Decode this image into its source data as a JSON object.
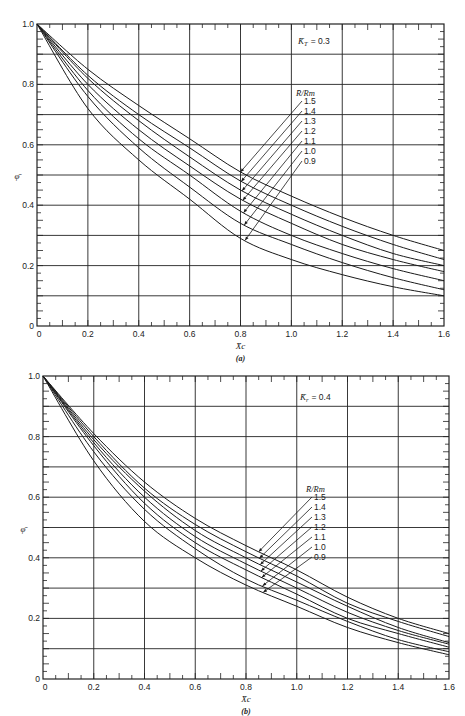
{
  "chart_data": [
    {
      "panel": "(a)",
      "type": "line",
      "title": "",
      "annotation": "K̄T = 0.3",
      "annotation_param": "K_T",
      "annotation_value": "0.3",
      "xlabel": "X̄c",
      "ylabel": "φ̄",
      "xlim": [
        0,
        1.6
      ],
      "ylim": [
        0,
        1.0
      ],
      "xticks": [
        "0",
        "0.2",
        "0.4",
        "0.6",
        "0.8",
        "1.0",
        "1.2",
        "1.4",
        "1.6"
      ],
      "yticks": [
        "0",
        "0.2",
        "0.4",
        "0.6",
        "0.8",
        "1.0"
      ],
      "grid": true,
      "legend_title": "R̄/Rm",
      "legend_position": "inline-right-of-curves",
      "x": [
        0,
        0.2,
        0.4,
        0.6,
        0.8,
        1.0,
        1.2,
        1.4,
        1.6
      ],
      "series": [
        {
          "name": "1.5",
          "values": [
            1.0,
            0.85,
            0.73,
            0.62,
            0.51,
            0.43,
            0.36,
            0.3,
            0.25
          ]
        },
        {
          "name": "1.4",
          "values": [
            1.0,
            0.83,
            0.7,
            0.59,
            0.48,
            0.4,
            0.33,
            0.27,
            0.22
          ]
        },
        {
          "name": "1.3",
          "values": [
            1.0,
            0.82,
            0.68,
            0.56,
            0.45,
            0.37,
            0.3,
            0.24,
            0.2
          ]
        },
        {
          "name": "1.2",
          "values": [
            1.0,
            0.8,
            0.65,
            0.53,
            0.42,
            0.34,
            0.27,
            0.22,
            0.18
          ]
        },
        {
          "name": "1.1",
          "values": [
            1.0,
            0.78,
            0.62,
            0.5,
            0.38,
            0.3,
            0.24,
            0.19,
            0.15
          ]
        },
        {
          "name": "1.0",
          "values": [
            1.0,
            0.76,
            0.59,
            0.46,
            0.34,
            0.27,
            0.21,
            0.16,
            0.12
          ]
        },
        {
          "name": "0.9",
          "values": [
            1.0,
            0.72,
            0.55,
            0.42,
            0.29,
            0.22,
            0.17,
            0.13,
            0.1
          ]
        }
      ]
    },
    {
      "panel": "(b)",
      "type": "line",
      "title": "",
      "annotation": "K̄r = 0.4",
      "annotation_param": "K_r",
      "annotation_value": "0.4",
      "xlabel": "X̄c",
      "ylabel": "φ̄",
      "xlim": [
        0,
        1.6
      ],
      "ylim": [
        0,
        1.0
      ],
      "xticks": [
        "0",
        "0.2",
        "0.4",
        "0.6",
        "0.8",
        "1.0",
        "1.2",
        "1.4",
        "1.6"
      ],
      "yticks": [
        "0",
        "0.2",
        "0.4",
        "0.6",
        "0.8",
        "1.0"
      ],
      "grid": true,
      "legend_title": "R̄/Rm",
      "legend_position": "inline-right-of-curves",
      "x": [
        0,
        0.2,
        0.4,
        0.6,
        0.8,
        1.0,
        1.2,
        1.4,
        1.6
      ],
      "series": [
        {
          "name": "1.5",
          "values": [
            1.0,
            0.81,
            0.65,
            0.53,
            0.44,
            0.36,
            0.27,
            0.2,
            0.15
          ]
        },
        {
          "name": "1.4",
          "values": [
            1.0,
            0.8,
            0.63,
            0.51,
            0.42,
            0.34,
            0.25,
            0.19,
            0.14
          ]
        },
        {
          "name": "1.3",
          "values": [
            1.0,
            0.79,
            0.62,
            0.49,
            0.4,
            0.32,
            0.24,
            0.17,
            0.12
          ]
        },
        {
          "name": "1.2",
          "values": [
            1.0,
            0.78,
            0.6,
            0.47,
            0.38,
            0.3,
            0.22,
            0.16,
            0.115
          ]
        },
        {
          "name": "1.1",
          "values": [
            1.0,
            0.77,
            0.58,
            0.45,
            0.36,
            0.28,
            0.2,
            0.15,
            0.105
          ]
        },
        {
          "name": "1.0",
          "values": [
            1.0,
            0.75,
            0.56,
            0.43,
            0.33,
            0.26,
            0.19,
            0.13,
            0.09
          ]
        },
        {
          "name": "0.9",
          "values": [
            1.0,
            0.72,
            0.52,
            0.4,
            0.31,
            0.24,
            0.17,
            0.12,
            0.08
          ]
        }
      ]
    }
  ],
  "panels": [
    {
      "label": "(a)",
      "annotation_symbol": "K̄",
      "annotation_sub": "T",
      "annotation_eq": "= 0.3",
      "legend_title": "R̄/Rm",
      "xlabel": "X̄c",
      "ylabel": "φ̄"
    },
    {
      "label": "(b)",
      "annotation_symbol": "K̄",
      "annotation_sub": "r",
      "annotation_eq": "= 0.4",
      "legend_title": "R̄/Rm",
      "xlabel": "X̄c",
      "ylabel": "φ̄"
    }
  ]
}
